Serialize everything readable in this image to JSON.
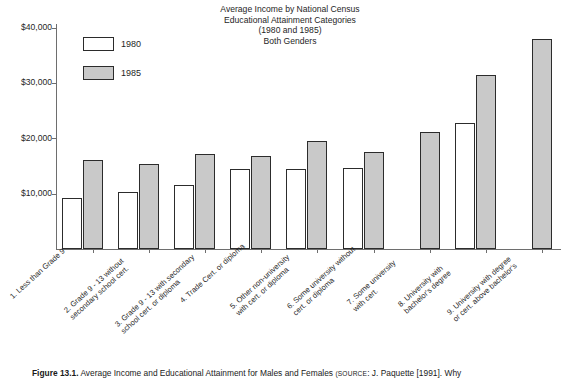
{
  "chart_data": {
    "type": "bar",
    "title": "Average Income by National Census Educational Attainment Categories (1980 and 1985) Both Genders",
    "title_lines": [
      "Average Income by National Census",
      "Educational Attainment Categories",
      "(1980 and 1985)",
      "Both Genders"
    ],
    "xlabel": "",
    "ylabel": "",
    "ylim": [
      0,
      40000
    ],
    "grid": false,
    "legend_position": "top-left",
    "y_ticks": [
      10000,
      20000,
      30000,
      40000
    ],
    "y_tick_labels": [
      "$10,000",
      "$20,000",
      "$30,000",
      "$40,000"
    ],
    "categories": [
      "1. Less than Grade 9",
      "2. Grade 9 - 13 without secondary school cert.",
      "3. Grade 9 - 13 with secondary school cert. or diploma",
      "4. Trade Cert. or diploma",
      "5. Other non-university with cert. or diploma",
      "6. Some university without cert. or diploma",
      "7. Some university with cert.",
      "8. University with bachelor's degree",
      "9. University with degree or cert. above bachelor's"
    ],
    "category_lines": [
      [
        "1. Less than Grade 9"
      ],
      [
        "2. Grade 9 - 13 without",
        "secondary school cert."
      ],
      [
        "3. Grade 9 - 13 with secondary",
        "school cert. or diploma"
      ],
      [
        "4. Trade Cert. or diploma"
      ],
      [
        "5. Other non-university",
        "with cert. or diploma"
      ],
      [
        "6. Some university without",
        "cert. or diploma"
      ],
      [
        "7. Some university",
        "with cert."
      ],
      [
        "8. University with",
        "bachelor's degree"
      ],
      [
        "9. University with degree",
        "or cert. above bachelor's"
      ]
    ],
    "series": [
      {
        "name": "1980",
        "color": "#ffffff",
        "values": [
          9300,
          10300,
          11500,
          14400,
          14400,
          14600,
          null,
          22700,
          null
        ]
      },
      {
        "name": "1985",
        "color": "#c9c9c9",
        "values": [
          16000,
          15300,
          17200,
          16800,
          19500,
          17600,
          21100,
          31500,
          38000
        ]
      }
    ]
  },
  "legend": {
    "items": [
      {
        "label": "1980",
        "swatch": "white-swatch"
      },
      {
        "label": "1985",
        "swatch": "gray-swatch"
      }
    ]
  },
  "caption": {
    "figure_number": "Figure 13.1.",
    "text": " Average Income and Educational Attainment for Males and Females ",
    "source_label": "(SOURCE",
    "source_text": ": J. Paquette [1991]. Why"
  }
}
